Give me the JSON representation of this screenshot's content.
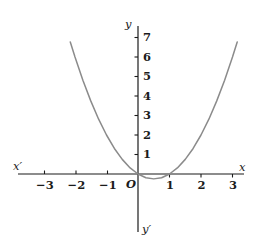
{
  "chart_data": {
    "type": "line",
    "title": "",
    "xlabel": "x",
    "ylabel": "y",
    "grid": false,
    "legend": "none",
    "xlim": [
      -3.8,
      3.8
    ],
    "ylim": [
      -1.9,
      7.6
    ],
    "xticks": [
      -3,
      -2,
      -1,
      1,
      2,
      3
    ],
    "yticks": [
      1,
      2,
      3,
      4,
      5,
      6,
      7
    ],
    "xtick_labels": [
      "−3",
      "−2",
      "−1",
      "1",
      "2",
      "3"
    ],
    "ytick_labels": [
      "1",
      "2",
      "3",
      "4",
      "5",
      "6",
      "7"
    ],
    "origin_label": "O",
    "axis_labels": {
      "x_positive": "x",
      "x_negative": "x′",
      "y_positive": "y",
      "y_negative": "y′"
    },
    "series": [
      {
        "name": "y = x² − x",
        "equation": "y = x^2 - x",
        "roots": [
          0,
          1
        ],
        "vertex": [
          0.5,
          -0.25
        ],
        "color": "#8b8b8b",
        "x": [
          -2.15,
          -2.0,
          -1.75,
          -1.5,
          -1.25,
          -1.0,
          -0.75,
          -0.5,
          -0.25,
          0.0,
          0.25,
          0.5,
          0.75,
          1.0,
          1.25,
          1.5,
          1.75,
          2.0,
          2.25,
          2.5,
          2.75,
          3.0,
          3.15
        ],
        "values": [
          6.77,
          6.0,
          4.81,
          3.75,
          2.81,
          2.0,
          1.31,
          0.75,
          0.31,
          0.0,
          -0.19,
          -0.25,
          -0.19,
          0.0,
          0.31,
          0.75,
          1.31,
          2.0,
          2.81,
          3.75,
          4.81,
          6.0,
          6.77
        ]
      }
    ]
  },
  "style": {
    "axis_color": "#1b1b1b",
    "curve_color": "#8b8b8b",
    "background": "#ffffff"
  }
}
